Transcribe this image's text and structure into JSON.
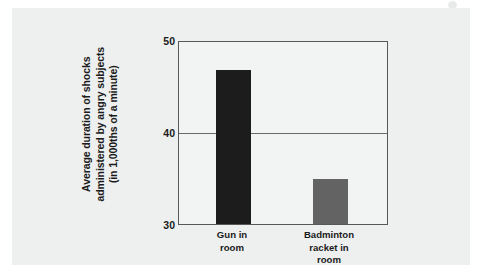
{
  "chart_data": {
    "type": "bar",
    "title": "",
    "subtitle": "",
    "xlabel": "",
    "ylabel": "Average duration of shocks\nadministered by angry subjects\n(in 1,000ths of a minute)",
    "categories": [
      "Gun in\nroom",
      "Badminton\nracket in\nroom"
    ],
    "values": [
      46.9,
      34.9
    ],
    "bar_colors": [
      "#1c1c1c",
      "#636363"
    ],
    "ylim": [
      30,
      50
    ],
    "yticks": [
      30,
      40,
      50
    ],
    "ytick_labels": [
      "30",
      "40",
      "50"
    ],
    "grid": true,
    "gridlines_at": [
      40
    ],
    "legend": "none",
    "annotations": []
  },
  "figure": {
    "panel_background": "#eef0ef",
    "plot_background": "#f2f3f3",
    "frame_color": "#585858",
    "text_color": "#1b1b1b"
  },
  "artifact": {
    "name": "scan-speck"
  }
}
